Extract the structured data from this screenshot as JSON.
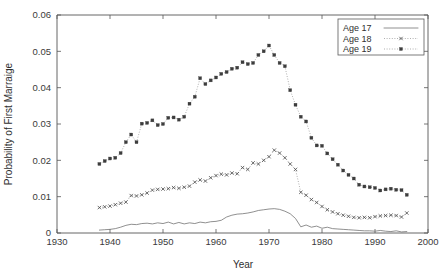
{
  "chart_data": {
    "type": "line",
    "title": "",
    "xlabel": "Year",
    "ylabel": "Probability of First Marraige",
    "xlim": [
      1930,
      2000
    ],
    "ylim": [
      0,
      0.06
    ],
    "xticks": [
      1930,
      1940,
      1950,
      1960,
      1970,
      1980,
      1990,
      2000
    ],
    "xtick_labels": [
      "1930",
      "1940",
      "1950",
      "1960",
      "1970",
      "1980",
      "1990",
      "2000"
    ],
    "yticks": [
      0,
      0.01,
      0.02,
      0.03,
      0.04,
      0.05,
      0.06
    ],
    "ytick_labels": [
      "0",
      "0.01",
      "0.02",
      "0.03",
      "0.04",
      "0.05",
      "0.06"
    ],
    "grid": false,
    "legend_position": "top-right",
    "x": [
      1938,
      1939,
      1940,
      1941,
      1942,
      1943,
      1944,
      1945,
      1946,
      1947,
      1948,
      1949,
      1950,
      1951,
      1952,
      1953,
      1954,
      1955,
      1956,
      1957,
      1958,
      1959,
      1960,
      1961,
      1962,
      1963,
      1964,
      1965,
      1966,
      1967,
      1968,
      1969,
      1970,
      1971,
      1972,
      1973,
      1974,
      1975,
      1976,
      1977,
      1978,
      1979,
      1980,
      1981,
      1982,
      1983,
      1984,
      1985,
      1986,
      1987,
      1988,
      1989,
      1990,
      1991,
      1992,
      1993,
      1994,
      1995,
      1996
    ],
    "series": [
      {
        "name": "Age 17",
        "style": "solid",
        "marker": "none",
        "color": "#6b6b6b",
        "values": [
          0.0008,
          0.0009,
          0.001,
          0.0012,
          0.0016,
          0.0021,
          0.0024,
          0.0023,
          0.0026,
          0.0027,
          0.0025,
          0.0028,
          0.0026,
          0.003,
          0.0025,
          0.0029,
          0.0025,
          0.0028,
          0.0026,
          0.003,
          0.0028,
          0.0031,
          0.0032,
          0.0035,
          0.0044,
          0.0049,
          0.0052,
          0.0053,
          0.0055,
          0.0058,
          0.0062,
          0.0064,
          0.0066,
          0.0067,
          0.0065,
          0.006,
          0.0053,
          0.004,
          0.0017,
          0.0022,
          0.0016,
          0.0019,
          0.0013,
          0.0016,
          0.0012,
          0.0011,
          0.001,
          0.0009,
          0.0008,
          0.0007,
          0.0006,
          0.0006,
          0.0005,
          0.0007,
          0.0005,
          0.0004,
          0.0006,
          0.0003,
          0.0004
        ]
      },
      {
        "name": "Age 18",
        "style": "dotted",
        "marker": "x",
        "color": "#4a4a4a",
        "values": [
          0.007,
          0.0072,
          0.0074,
          0.0078,
          0.0082,
          0.0085,
          0.0103,
          0.0102,
          0.0105,
          0.011,
          0.0118,
          0.012,
          0.0121,
          0.0122,
          0.0125,
          0.0123,
          0.0126,
          0.0129,
          0.014,
          0.0146,
          0.0143,
          0.0152,
          0.0158,
          0.0162,
          0.016,
          0.0165,
          0.0163,
          0.018,
          0.0175,
          0.0193,
          0.019,
          0.02,
          0.021,
          0.0228,
          0.022,
          0.0207,
          0.019,
          0.0175,
          0.0112,
          0.0104,
          0.0092,
          0.0084,
          0.0073,
          0.0064,
          0.0058,
          0.0053,
          0.0049,
          0.0046,
          0.0043,
          0.0042,
          0.0043,
          0.0042,
          0.0045,
          0.0047,
          0.0048,
          0.0049,
          0.0048,
          0.0044,
          0.0055
        ]
      },
      {
        "name": "Age 19",
        "style": "dotted",
        "marker": "square",
        "color": "#3d3d3d",
        "values": [
          0.019,
          0.0198,
          0.0205,
          0.0207,
          0.022,
          0.025,
          0.0271,
          0.025,
          0.0301,
          0.0303,
          0.031,
          0.0297,
          0.03,
          0.0317,
          0.0318,
          0.0312,
          0.032,
          0.0356,
          0.0375,
          0.0426,
          0.041,
          0.042,
          0.0428,
          0.0438,
          0.0443,
          0.0452,
          0.0455,
          0.047,
          0.0465,
          0.0468,
          0.049,
          0.05,
          0.0516,
          0.049,
          0.0468,
          0.0459,
          0.0393,
          0.0353,
          0.032,
          0.0307,
          0.0262,
          0.0241,
          0.024,
          0.0219,
          0.0203,
          0.0188,
          0.0172,
          0.016,
          0.015,
          0.0133,
          0.0128,
          0.0126,
          0.0124,
          0.0117,
          0.012,
          0.0122,
          0.0119,
          0.0118,
          0.0105
        ]
      }
    ]
  },
  "legend": {
    "entries": [
      {
        "label": "Age 17"
      },
      {
        "label": "Age 18"
      },
      {
        "label": "Age 19"
      }
    ]
  },
  "caption": {
    "ghost_text": ""
  }
}
